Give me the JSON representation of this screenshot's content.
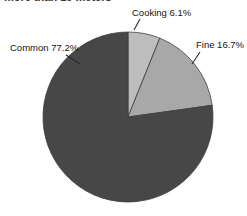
{
  "figure": {
    "background_color": "#ffffff",
    "clipped_title": "more than 10 meters"
  },
  "chart_data": {
    "type": "pie",
    "title": "",
    "xlabel": "",
    "ylabel": "",
    "legend_position": "none",
    "labels_inline": true,
    "start_angle_deg": 0,
    "direction": "clockwise",
    "categories": [
      "Cooking",
      "Fine",
      "Common"
    ],
    "values": [
      6.1,
      16.7,
      77.2
    ],
    "value_unit": "%",
    "slice_colors": [
      "#bdbdbd",
      "#a8a8a8",
      "#474747"
    ],
    "slice_edge_color": "#3d3d3d",
    "labels": [
      {
        "category": "Cooking",
        "value": 6.1,
        "text": "Cooking 6.1%",
        "color": "#bdbdbd",
        "label_x": 132,
        "label_y": 16,
        "leader_from_x": 140,
        "leader_from_y": 19,
        "leader_to_x": 134,
        "leader_to_y": 30
      },
      {
        "category": "Fine",
        "value": 16.7,
        "text": "Fine 16.7%",
        "color": "#a8a8a8",
        "label_x": 196,
        "label_y": 48,
        "leader_from_x": 200,
        "leader_from_y": 52,
        "leader_to_x": 192,
        "leader_to_y": 64
      },
      {
        "category": "Common",
        "value": 77.2,
        "text": "Common 77.2%",
        "color": "#474747",
        "label_x": 10,
        "label_y": 51,
        "leader_from_x": 66,
        "leader_from_y": 55,
        "leader_to_x": 80,
        "leader_to_y": 64
      }
    ],
    "geometry": {
      "center_x": 128,
      "center_y": 117,
      "radius": 85
    }
  }
}
